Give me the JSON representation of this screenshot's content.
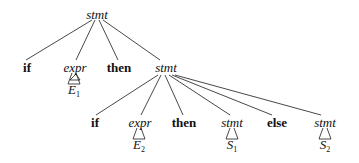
{
  "diagram": {
    "type": "parse-tree",
    "root": {
      "label": "stmt",
      "kind": "nonterminal"
    },
    "level1": [
      {
        "label": "if",
        "kind": "keyword"
      },
      {
        "label": "expr",
        "kind": "nonterminal",
        "subtree": "E",
        "subscript": "1"
      },
      {
        "label": "then",
        "kind": "keyword"
      },
      {
        "label": "stmt",
        "kind": "nonterminal"
      }
    ],
    "level2": [
      {
        "label": "if",
        "kind": "keyword"
      },
      {
        "label": "expr",
        "kind": "nonterminal",
        "subtree": "E",
        "subscript": "2"
      },
      {
        "label": "then",
        "kind": "keyword"
      },
      {
        "label": "stmt",
        "kind": "nonterminal",
        "subtree": "S",
        "subscript": "1"
      },
      {
        "label": "else",
        "kind": "keyword"
      },
      {
        "label": "stmt",
        "kind": "nonterminal",
        "subtree": "S",
        "subscript": "2"
      }
    ]
  }
}
